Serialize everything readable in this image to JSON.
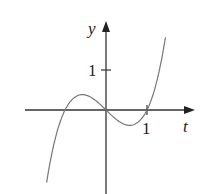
{
  "chart_data": {
    "type": "line",
    "title": "",
    "xlabel": "t",
    "ylabel": "y",
    "x_ticks": [
      {
        "value": 1,
        "label": "1"
      }
    ],
    "y_ticks": [
      {
        "value": 1,
        "label": "1"
      }
    ],
    "function": "y = t^3 - t (approximate cubic with roots at -1, 0, 1)",
    "x": [
      -1.45,
      -1.2,
      -1.0,
      -0.8,
      -0.58,
      -0.4,
      -0.2,
      0,
      0.2,
      0.4,
      0.58,
      0.8,
      1.0,
      1.2,
      1.45
    ],
    "series": [
      {
        "name": "curve",
        "values": [
          -2.0,
          -0.73,
          0.0,
          0.31,
          0.42,
          0.36,
          0.2,
          0.0,
          -0.2,
          -0.36,
          -0.42,
          -0.31,
          0.0,
          0.73,
          2.0
        ]
      }
    ],
    "xlim": [
      -2.0,
      2.2
    ],
    "ylim": [
      -2.1,
      2.2
    ],
    "grid": false,
    "legend": "none",
    "colors": {
      "axes": "#333333",
      "curve": "#777777",
      "text": "#222222"
    }
  },
  "labels": {
    "x_axis": "t",
    "y_axis": "y",
    "x_tick": "1",
    "y_tick": "1"
  }
}
